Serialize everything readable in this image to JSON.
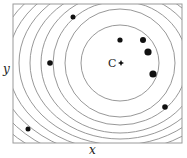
{
  "diagram": {
    "type": "contour-plot",
    "frame": {
      "x": 13,
      "y": 4,
      "width": 169,
      "height": 139,
      "stroke": "#9a9a9a"
    },
    "center": {
      "label": "C",
      "x": 121,
      "y": 63,
      "marker": "star"
    },
    "contours": {
      "stroke": "#8c8c8c",
      "cx": 120,
      "cy": 63,
      "ellipses": [
        {
          "rx": 39,
          "ry": 38
        },
        {
          "rx": 55,
          "ry": 54
        },
        {
          "rx": 67,
          "ry": 62
        },
        {
          "rx": 79,
          "ry": 70
        },
        {
          "rx": 90,
          "ry": 76
        },
        {
          "rx": 101,
          "ry": 82
        },
        {
          "rx": 112,
          "ry": 88
        },
        {
          "rx": 123,
          "ry": 94
        },
        {
          "rx": 134,
          "ry": 100
        },
        {
          "rx": 145,
          "ry": 106
        }
      ]
    },
    "points": [
      {
        "x": 73,
        "y": 17,
        "r": 2.5
      },
      {
        "x": 50,
        "y": 63,
        "r": 2.8
      },
      {
        "x": 120,
        "y": 40,
        "r": 2.6
      },
      {
        "x": 143,
        "y": 40,
        "r": 3.0
      },
      {
        "x": 148,
        "y": 52,
        "r": 3.6
      },
      {
        "x": 153,
        "y": 74,
        "r": 3.6
      },
      {
        "x": 165,
        "y": 107,
        "r": 2.8
      },
      {
        "x": 28,
        "y": 129,
        "r": 2.5
      }
    ],
    "point_color": "#111111"
  },
  "labels": {
    "x_axis": "x",
    "y_axis": "y",
    "center": "C"
  }
}
